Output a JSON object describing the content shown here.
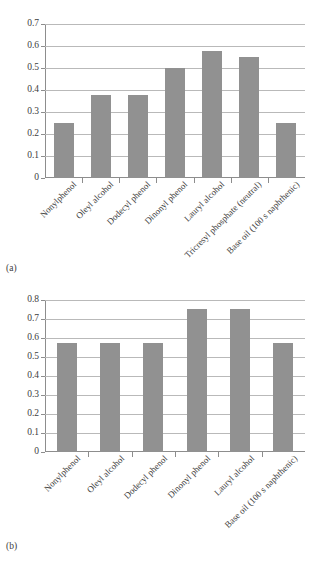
{
  "page": {
    "running_head": "",
    "background": "#ffffff",
    "bar_color": "#919191",
    "gridline_color": "#b9b9b9",
    "axis_color": "#8d8d8d"
  },
  "figures": [
    {
      "id": "a",
      "caption": "(a)"
    },
    {
      "id": "b",
      "caption": "(b)"
    }
  ],
  "chart_data": [
    {
      "type": "bar",
      "id": "a",
      "title": "",
      "xlabel": "",
      "ylabel": "",
      "ylim": [
        0,
        0.7
      ],
      "yticks": [
        0,
        0.1,
        0.2,
        0.3,
        0.4,
        0.5,
        0.6,
        0.7
      ],
      "ytick_labels": [
        "0",
        "0.1",
        "0.2",
        "0.3",
        "0.4",
        "0.5",
        "0.6",
        "0.7"
      ],
      "grid": "horizontal",
      "legend": "none",
      "categories": [
        "Nonylphenol",
        "Oleyl alcohol",
        "Dodecyl phenol",
        "Dinonyl phenol",
        "Lauryl alcohol",
        "Tricresyl phosphate (neutral)",
        "Base oil (100 s naphthenic)"
      ],
      "values": [
        0.25,
        0.375,
        0.375,
        0.5,
        0.575,
        0.55,
        0.25
      ]
    },
    {
      "type": "bar",
      "id": "b",
      "title": "",
      "xlabel": "",
      "ylabel": "",
      "ylim": [
        0,
        0.8
      ],
      "yticks": [
        0,
        0.1,
        0.2,
        0.3,
        0.4,
        0.5,
        0.6,
        0.7,
        0.8
      ],
      "ytick_labels": [
        "0",
        "0.1",
        "0.2",
        "0.3",
        "0.4",
        "0.5",
        "0.6",
        "0.7",
        "0.8"
      ],
      "grid": "horizontal",
      "legend": "none",
      "categories": [
        "Nonylphenol",
        "Oleyl alcohol",
        "Dodecyl phenol",
        "Dinonyl phenol",
        "Lauryl alcohol",
        "Base oil (100 s naphthenic)"
      ],
      "values": [
        0.575,
        0.575,
        0.575,
        0.75,
        0.75,
        0.575
      ]
    }
  ]
}
